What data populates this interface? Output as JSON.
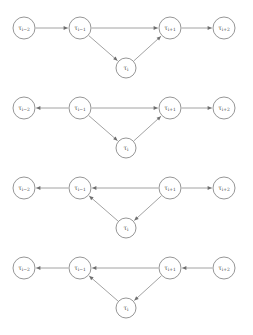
{
  "figure": {
    "background_color": "#ffffff",
    "node_stroke_color": "#8a8a8a",
    "edge_color": "#8a8a8a",
    "arrow_color": "#6f6f6f",
    "label_color": "#4a4a4a",
    "width": 253,
    "height": 335,
    "panel_count": 4
  },
  "labels": {
    "tau_i_minus_2": {
      "base": "τ",
      "sub": "i−2",
      "full": "τi−2"
    },
    "tau_i_minus_1": {
      "base": "τ",
      "sub": "i−1",
      "full": "τi−1"
    },
    "tau_i": {
      "base": "τ",
      "sub": "i",
      "full": "τi"
    },
    "tau_i_plus_1": {
      "base": "τ",
      "sub": "i+1",
      "full": "τi+1"
    },
    "tau_i_plus_2": {
      "base": "τ",
      "sub": "i+2",
      "full": "τi+2"
    }
  },
  "panels": [
    {
      "index": 1,
      "name": "panel-1",
      "y_center": 28,
      "nodes": [
        {
          "id": "n1",
          "label_key": "tau_i_minus_2",
          "x": 24,
          "dy": 0,
          "r": 11
        },
        {
          "id": "n2",
          "label_key": "tau_i_minus_1",
          "x": 80,
          "dy": 0,
          "r": 11
        },
        {
          "id": "n3",
          "label_key": "tau_i",
          "x": 126,
          "dy": 40,
          "r": 10
        },
        {
          "id": "n4",
          "label_key": "tau_i_plus_1",
          "x": 170,
          "dy": 0,
          "r": 11
        },
        {
          "id": "n5",
          "label_key": "tau_i_plus_2",
          "x": 224,
          "dy": 0,
          "r": 11
        }
      ],
      "edges": [
        {
          "from": "n1",
          "to": "n2"
        },
        {
          "from": "n2",
          "to": "n4"
        },
        {
          "from": "n2",
          "to": "n3"
        },
        {
          "from": "n3",
          "to": "n4"
        },
        {
          "from": "n4",
          "to": "n5"
        }
      ]
    },
    {
      "index": 2,
      "name": "panel-2",
      "y_center": 108,
      "nodes": [
        {
          "id": "n1",
          "label_key": "tau_i_minus_2",
          "x": 24,
          "dy": 0,
          "r": 11
        },
        {
          "id": "n2",
          "label_key": "tau_i_minus_1",
          "x": 80,
          "dy": 0,
          "r": 11
        },
        {
          "id": "n3",
          "label_key": "tau_i",
          "x": 126,
          "dy": 40,
          "r": 10
        },
        {
          "id": "n4",
          "label_key": "tau_i_plus_1",
          "x": 170,
          "dy": 0,
          "r": 11
        },
        {
          "id": "n5",
          "label_key": "tau_i_plus_2",
          "x": 224,
          "dy": 0,
          "r": 11
        }
      ],
      "edges": [
        {
          "from": "n2",
          "to": "n1"
        },
        {
          "from": "n2",
          "to": "n4"
        },
        {
          "from": "n2",
          "to": "n3"
        },
        {
          "from": "n3",
          "to": "n4"
        },
        {
          "from": "n4",
          "to": "n5"
        }
      ]
    },
    {
      "index": 3,
      "name": "panel-3",
      "y_center": 188,
      "nodes": [
        {
          "id": "n1",
          "label_key": "tau_i_minus_2",
          "x": 24,
          "dy": 0,
          "r": 11
        },
        {
          "id": "n2",
          "label_key": "tau_i_minus_1",
          "x": 80,
          "dy": 0,
          "r": 11
        },
        {
          "id": "n3",
          "label_key": "tau_i",
          "x": 126,
          "dy": 40,
          "r": 10
        },
        {
          "id": "n4",
          "label_key": "tau_i_plus_1",
          "x": 170,
          "dy": 0,
          "r": 11
        },
        {
          "id": "n5",
          "label_key": "tau_i_plus_2",
          "x": 224,
          "dy": 0,
          "r": 11
        }
      ],
      "edges": [
        {
          "from": "n2",
          "to": "n1"
        },
        {
          "from": "n4",
          "to": "n2"
        },
        {
          "from": "n3",
          "to": "n2"
        },
        {
          "from": "n4",
          "to": "n3"
        },
        {
          "from": "n4",
          "to": "n5"
        }
      ]
    },
    {
      "index": 4,
      "name": "panel-4",
      "y_center": 268,
      "nodes": [
        {
          "id": "n1",
          "label_key": "tau_i_minus_2",
          "x": 24,
          "dy": 0,
          "r": 11
        },
        {
          "id": "n2",
          "label_key": "tau_i_minus_1",
          "x": 80,
          "dy": 0,
          "r": 11
        },
        {
          "id": "n3",
          "label_key": "tau_i",
          "x": 126,
          "dy": 40,
          "r": 10
        },
        {
          "id": "n4",
          "label_key": "tau_i_plus_1",
          "x": 170,
          "dy": 0,
          "r": 11
        },
        {
          "id": "n5",
          "label_key": "tau_i_plus_2",
          "x": 224,
          "dy": 0,
          "r": 11
        }
      ],
      "edges": [
        {
          "from": "n2",
          "to": "n1"
        },
        {
          "from": "n4",
          "to": "n2"
        },
        {
          "from": "n3",
          "to": "n2"
        },
        {
          "from": "n4",
          "to": "n3"
        },
        {
          "from": "n5",
          "to": "n4"
        }
      ]
    }
  ],
  "caption": {
    "clipped_text": " "
  }
}
